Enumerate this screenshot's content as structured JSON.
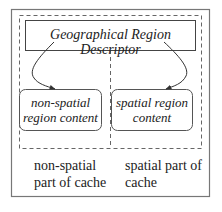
{
  "diagram": {
    "descriptor": {
      "label": "Geographical Region Descriptor"
    },
    "left_content": {
      "line1": "non-spatial",
      "line2": "region content"
    },
    "right_content": {
      "line1": "spatial region",
      "line2": "content"
    },
    "left_caption": {
      "line1": "non-spatial",
      "line2": "part of cache"
    },
    "right_caption": {
      "line1": "spatial part of",
      "line2": "cache"
    },
    "colors": {
      "stroke": "#555555",
      "text": "#222222",
      "frame": "#777777"
    }
  }
}
